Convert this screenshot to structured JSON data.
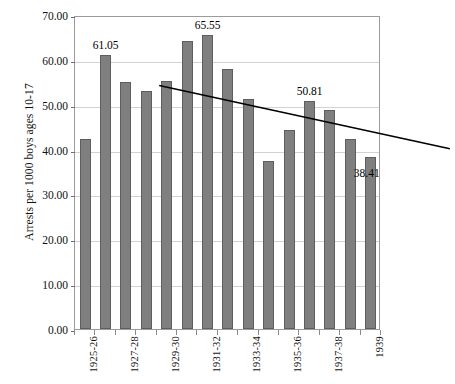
{
  "chart_data": {
    "type": "bar",
    "title": "",
    "xlabel": "",
    "ylabel": "Arrests per 1000 boys ages 10-17",
    "ylim": [
      0,
      70
    ],
    "ytick_labels": [
      "0.00",
      "10.00",
      "20.00",
      "30.00",
      "40.00",
      "50.00",
      "60.00",
      "70.00"
    ],
    "ytick_values": [
      0,
      10,
      20,
      30,
      40,
      50,
      60,
      70
    ],
    "grid": true,
    "legend": "none",
    "categories": [
      "1925",
      "1926",
      "1927",
      "1928",
      "1929",
      "1930",
      "1931",
      "1932",
      "1933",
      "1934",
      "1935",
      "1936",
      "1937",
      "1938",
      "1939"
    ],
    "xtick_labels": [
      "1925-26",
      "1927-28",
      "1929-30",
      "1931-32",
      "1933-34",
      "1935-36",
      "1937-38",
      "1939"
    ],
    "xtick_label_indices": [
      0,
      2,
      4,
      6,
      8,
      10,
      12,
      14
    ],
    "values": [
      42.3,
      61.05,
      55.0,
      53.0,
      55.3,
      64.1,
      65.55,
      58.0,
      51.3,
      37.4,
      44.3,
      50.81,
      48.8,
      42.3,
      38.41
    ],
    "data_labels": [
      {
        "index": 1,
        "text": "61.05",
        "value": 61.05
      },
      {
        "index": 6,
        "text": "65.55",
        "value": 65.55
      },
      {
        "index": 11,
        "text": "50.81",
        "value": 50.81
      },
      {
        "index": 14,
        "text": "38.41",
        "value": 38.41
      }
    ],
    "trendline": {
      "type": "linear",
      "start_value": 58.3,
      "end_value": 44.2,
      "color": "#000000"
    },
    "colors": {
      "bar_fill": "#7f7f7f",
      "bar_border": "#5e5e5e",
      "grid": "#d2d2d2",
      "axis": "#9b9b9b",
      "text": "#111111",
      "trendline": "#000000"
    }
  }
}
